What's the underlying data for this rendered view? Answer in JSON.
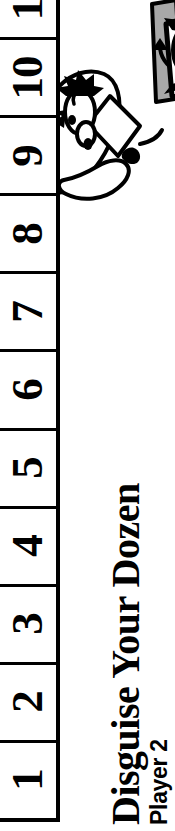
{
  "page": {
    "orientation": "rotated-90-ccw",
    "background_color": "#ffffff",
    "ink_color": "#000000",
    "accent_gray": "#a8a8a8",
    "width_px": 175,
    "height_px": 831
  },
  "title": {
    "game_title": "Disguise Your Dozen",
    "player_label": "Player 2"
  },
  "score_track": {
    "name": "score-track",
    "note": "vertical column of numbered boxes, top box clipped by page edge",
    "cells": [
      {
        "value": "11",
        "clipped": true
      },
      {
        "value": "10",
        "clipped": false
      },
      {
        "value": "9",
        "clipped": false
      },
      {
        "value": "8",
        "clipped": false
      },
      {
        "value": "7",
        "clipped": false
      },
      {
        "value": "6",
        "clipped": false
      },
      {
        "value": "5",
        "clipped": false
      },
      {
        "value": "4",
        "clipped": false
      },
      {
        "value": "3",
        "clipped": false
      },
      {
        "value": "2",
        "clipped": false
      },
      {
        "value": "1",
        "clipped": false
      }
    ]
  },
  "illustration": {
    "name": "cartoon-poodle-illustration",
    "description": "black-and-white line-art cartoon of two shaggy poodle-like characters wearing costumes, with a gray banner band",
    "band_color": "#a8a8a8",
    "line_color": "#000000"
  }
}
